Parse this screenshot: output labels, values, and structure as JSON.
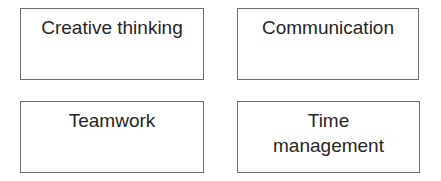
{
  "diagram": {
    "boxes": [
      {
        "lines": [
          "Creative thinking"
        ]
      },
      {
        "lines": [
          "Communication"
        ]
      },
      {
        "lines": [
          "Teamwork"
        ]
      },
      {
        "lines": [
          "Time",
          "management"
        ]
      }
    ]
  },
  "colors": {
    "border": "#6e6e6e",
    "text": "#262626",
    "background": "#ffffff"
  }
}
